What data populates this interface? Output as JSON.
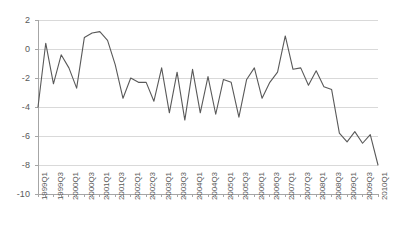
{
  "chart_data": {
    "type": "line",
    "title": "",
    "subtitle": "",
    "xlabel": "",
    "ylabel": "",
    "ylim": [
      -10,
      2
    ],
    "yticks": [
      2,
      0,
      -2,
      -4,
      -6,
      -8,
      -10
    ],
    "ytick_labels": [
      "2",
      "0",
      "-2",
      "-4",
      "-6",
      "-8",
      "-10"
    ],
    "grid": true,
    "grid_axis": "y",
    "legend": false,
    "legend_position": "none",
    "line_color": "#595959",
    "grid_color": "#d9d9d9",
    "axis_color": "#a6a6a6",
    "background_color": "#ffffff",
    "text_color": "#595959",
    "x": [
      "1999Q1",
      "1999Q2",
      "1999Q3",
      "1999Q4",
      "2000Q1",
      "2000Q2",
      "2000Q3",
      "2000Q4",
      "2001Q1",
      "2001Q2",
      "2001Q3",
      "2001Q4",
      "2002Q1",
      "2002Q2",
      "2002Q3",
      "2002Q4",
      "2003Q1",
      "2003Q2",
      "2003Q3",
      "2003Q4",
      "2004Q1",
      "2004Q2",
      "2004Q3",
      "2004Q4",
      "2005Q1",
      "2005Q2",
      "2005Q3",
      "2005Q4",
      "2006Q1",
      "2006Q2",
      "2006Q3",
      "2006Q4",
      "2007Q1",
      "2007Q2",
      "2007Q3",
      "2007Q4",
      "2008Q1",
      "2008Q2",
      "2008Q3",
      "2008Q4",
      "2009Q1",
      "2009Q2",
      "2009Q3",
      "2009Q4",
      "2010Q1"
    ],
    "xtick_labels": [
      "1999Q1",
      "1999Q3",
      "2000Q1",
      "2000Q3",
      "2001Q1",
      "2001Q3",
      "2002Q1",
      "2002Q3",
      "2003Q1",
      "2003Q3",
      "2004Q1",
      "2004Q3",
      "2005Q1",
      "2005Q3",
      "2006Q1",
      "2006Q3",
      "2007Q1",
      "2007Q3",
      "2008Q1",
      "2008Q3",
      "2009Q1",
      "2009Q3",
      "2010Q1"
    ],
    "xtick_label_stride": 2,
    "series": [
      {
        "name": "series-1",
        "values": [
          -4.0,
          0.4,
          -2.4,
          -0.4,
          -1.3,
          -2.7,
          0.8,
          1.1,
          1.2,
          0.6,
          -1.1,
          -3.4,
          -2.0,
          -2.3,
          -2.3,
          -3.6,
          -1.3,
          -4.4,
          -1.6,
          -4.9,
          -1.4,
          -4.4,
          -1.9,
          -4.5,
          -2.1,
          -2.3,
          -4.7,
          -2.1,
          -1.3,
          -3.4,
          -2.3,
          -1.6,
          0.9,
          -1.4,
          -1.3,
          -2.5,
          -1.5,
          -2.6,
          -2.8,
          -5.8,
          -6.4,
          -5.7,
          -6.5,
          -5.9,
          -8.0
        ]
      }
    ]
  }
}
